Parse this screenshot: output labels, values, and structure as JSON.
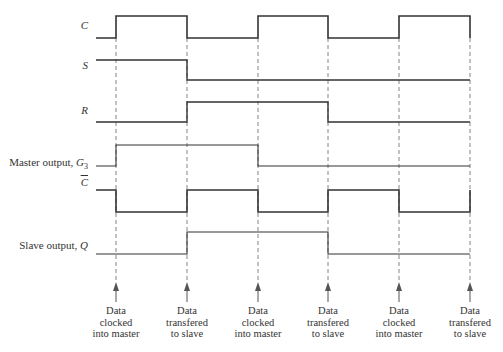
{
  "diagram": {
    "type": "timing-diagram",
    "signals": [
      {
        "id": "C",
        "label": "C",
        "label_style": "italic",
        "low_y": 38,
        "high_y": 16,
        "start": "low",
        "edges": [
          116,
          187,
          258,
          328,
          399,
          470
        ],
        "weight": 1.6
      },
      {
        "id": "S",
        "label": "S",
        "label_style": "italic",
        "low_y": 80,
        "high_y": 60,
        "start": "high",
        "edges": [
          187
        ],
        "weight": 1.4
      },
      {
        "id": "R",
        "label": "R",
        "label_style": "italic",
        "low_y": 122,
        "high_y": 102,
        "start": "low",
        "edges": [
          187,
          328
        ],
        "weight": 1.4
      },
      {
        "id": "G3",
        "label": "Master output, G",
        "label_sub": "3",
        "low_y": 166,
        "high_y": 145,
        "start": "low",
        "edges": [
          116,
          258
        ],
        "weight": 1.1
      },
      {
        "id": "Cbar",
        "label": "C",
        "label_overbar": true,
        "low_y": 212,
        "high_y": 190,
        "start": "high",
        "edges": [
          116,
          187,
          258,
          328,
          399,
          470
        ],
        "weight": 1.6
      },
      {
        "id": "Q",
        "label": "Slave output, ",
        "label_italic_suffix": "Q",
        "low_y": 254,
        "high_y": 232,
        "start": "low",
        "edges": [
          187,
          328
        ],
        "weight": 1.1
      }
    ],
    "x_start": 96,
    "x_end": 470,
    "dashed_guides_x": [
      116,
      187,
      258,
      328,
      399,
      470
    ],
    "guide_top": 38,
    "guide_bottom": 280,
    "arrows": [
      {
        "x": 116,
        "caption": [
          "Data",
          "clocked",
          "into master"
        ]
      },
      {
        "x": 187,
        "caption": [
          "Data",
          "transfered",
          "to slave"
        ]
      },
      {
        "x": 258,
        "caption": [
          "Data",
          "clocked",
          "into master"
        ]
      },
      {
        "x": 328,
        "caption": [
          "Data",
          "transfered",
          "to slave"
        ]
      },
      {
        "x": 399,
        "caption": [
          "Data",
          "clocked",
          "into master"
        ]
      },
      {
        "x": 470,
        "caption": [
          "Data",
          "transfered",
          "to slave"
        ]
      }
    ],
    "colors": {
      "line": "#333333",
      "dash": "#777777",
      "text": "#333333"
    }
  }
}
